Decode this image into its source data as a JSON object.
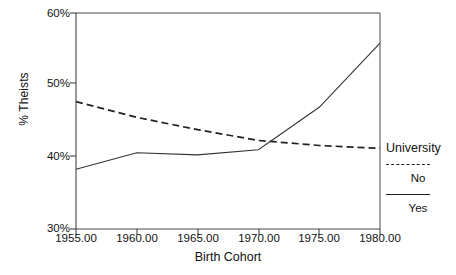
{
  "chart_data": {
    "type": "line",
    "title": "",
    "xlabel": "Birth Cohort",
    "ylabel": "% Theists",
    "xlim": [
      1955,
      1980
    ],
    "ylim": [
      30,
      60
    ],
    "grid": false,
    "legend_position": "right",
    "legend_title": "University",
    "x": [
      1955,
      1960,
      1965,
      1970,
      1975,
      1980
    ],
    "xtick_labels": [
      "1955.00",
      "1960.00",
      "1965.00",
      "1970.00",
      "1975.00",
      "1980.00"
    ],
    "ytick_labels": [
      "30%",
      "40%",
      "50%",
      "60%"
    ],
    "ytick_values": [
      30,
      40,
      50,
      60
    ],
    "series": [
      {
        "name": "No",
        "style": "dashed",
        "color": "#222222",
        "values": [
          47.7,
          45.5,
          43.8,
          42.3,
          41.6,
          41.2
        ]
      },
      {
        "name": "Yes",
        "style": "solid",
        "color": "#333333",
        "values": [
          38.3,
          40.6,
          40.3,
          41.0,
          46.9,
          55.8
        ]
      }
    ]
  },
  "legend": {
    "title": "University",
    "entries": [
      {
        "label": "No",
        "style": "dashed"
      },
      {
        "label": "Yes",
        "style": "solid"
      }
    ]
  },
  "axes": {
    "y_title": "% Theists",
    "x_title": "Birth Cohort"
  }
}
